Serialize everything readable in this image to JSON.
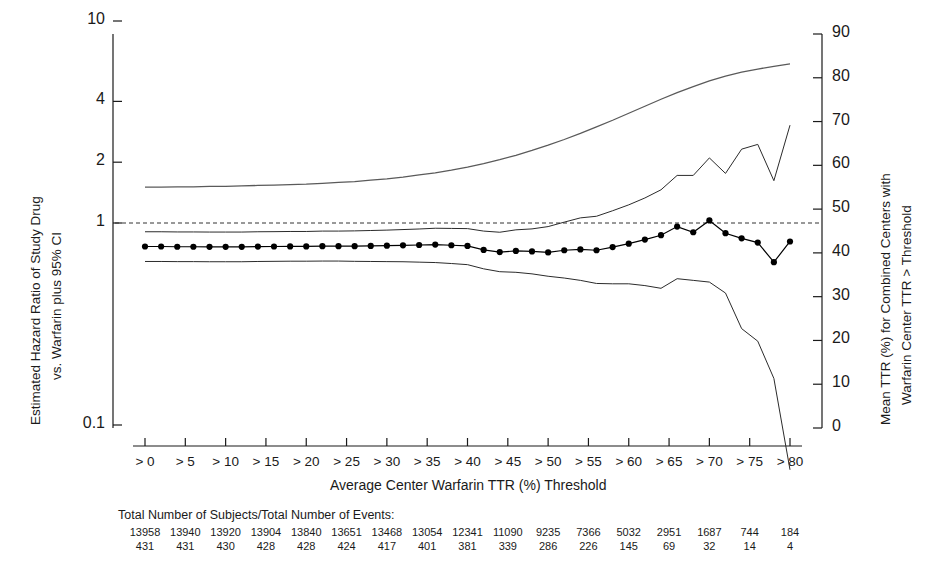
{
  "figure": {
    "background": "#ffffff",
    "ink": "#1a1a1a",
    "ttr_line_color": "#5a5a5a",
    "ci_line_color": "#2b2b2b",
    "point_color": "#000000",
    "reference_line_color": "#333333"
  },
  "axes": {
    "left": {
      "label_line1": "Estimated Hazard Ratio of Study Drug",
      "label_line2": "vs. Warfarin plus 95% CI",
      "scale": "log",
      "ticks": [
        "10",
        "4",
        "2",
        "1",
        "0.1"
      ],
      "tick_values": [
        10,
        4,
        2,
        1,
        0.1
      ],
      "range": [
        0.1,
        10
      ]
    },
    "right": {
      "label_line1": "Mean TTR (%) for Combined Centers with",
      "label_line2": "Warfarin Center TTR > Threshold",
      "scale": "linear",
      "ticks": [
        "90",
        "80",
        "70",
        "60",
        "50",
        "40",
        "30",
        "20",
        "10",
        "0"
      ],
      "tick_values": [
        90,
        80,
        70,
        60,
        50,
        40,
        30,
        20,
        10,
        0
      ],
      "range": [
        0,
        90
      ]
    },
    "x": {
      "label": "Average Center Warfarin TTR (%) Threshold",
      "ticks": [
        "> 0",
        "> 5",
        "> 10",
        "> 15",
        "> 20",
        "> 25",
        "> 30",
        "> 35",
        "> 40",
        "> 45",
        "> 50",
        "> 55",
        "> 60",
        "> 65",
        "> 70",
        "> 75",
        "> 80"
      ],
      "tick_values": [
        0,
        5,
        10,
        15,
        20,
        25,
        30,
        35,
        40,
        45,
        50,
        55,
        60,
        65,
        70,
        75,
        80
      ],
      "range": [
        0,
        80
      ]
    }
  },
  "reference_line": {
    "value": 1,
    "style": "dashed",
    "name": "hazard-ratio-unity"
  },
  "counts_table": {
    "title": "Total Number of Subjects/Total Number of Events:",
    "subjects": [
      13958,
      13940,
      13920,
      13904,
      13840,
      13651,
      13468,
      13054,
      12341,
      11090,
      9235,
      7366,
      5032,
      2951,
      1687,
      744,
      184
    ],
    "events": [
      431,
      431,
      430,
      428,
      428,
      424,
      417,
      401,
      381,
      339,
      286,
      226,
      145,
      69,
      32,
      14,
      4
    ]
  },
  "chart_data": {
    "type": "line",
    "title": "",
    "xlabel": "Average Center Warfarin TTR (%) Threshold",
    "ylabel": "Estimated Hazard Ratio of Study Drug vs. Warfarin plus 95% CI",
    "ylabel_right": "Mean TTR (%) for Combined Centers with Warfarin Center TTR > Threshold",
    "ylim": [
      0.1,
      10
    ],
    "ylim_right": [
      0,
      90
    ],
    "xlim": [
      0,
      80
    ],
    "yscale": "log",
    "grid": false,
    "legend": "none",
    "x": [
      0,
      2,
      4,
      6,
      8,
      10,
      12,
      14,
      16,
      18,
      20,
      22,
      24,
      26,
      28,
      30,
      32,
      34,
      36,
      38,
      40,
      42,
      44,
      46,
      48,
      50,
      52,
      54,
      56,
      58,
      60,
      62,
      64,
      66,
      68,
      70,
      72,
      74,
      76,
      78,
      80
    ],
    "series": [
      {
        "name": "Hazard Ratio (point estimate)",
        "axis": "left",
        "marker": "filled-circle",
        "values": [
          0.765,
          0.765,
          0.763,
          0.763,
          0.762,
          0.762,
          0.762,
          0.764,
          0.765,
          0.766,
          0.766,
          0.768,
          0.768,
          0.768,
          0.77,
          0.772,
          0.775,
          0.778,
          0.782,
          0.776,
          0.77,
          0.736,
          0.718,
          0.727,
          0.723,
          0.715,
          0.733,
          0.74,
          0.733,
          0.76,
          0.79,
          0.828,
          0.87,
          0.96,
          0.9,
          1.03,
          0.89,
          0.84,
          0.8,
          0.64,
          0.81
        ]
      },
      {
        "name": "Upper 95% CI",
        "axis": "left",
        "marker": "none",
        "values": [
          0.905,
          0.905,
          0.903,
          0.903,
          0.902,
          0.902,
          0.902,
          0.905,
          0.906,
          0.908,
          0.908,
          0.912,
          0.912,
          0.914,
          0.918,
          0.922,
          0.928,
          0.934,
          0.942,
          0.94,
          0.938,
          0.912,
          0.9,
          0.925,
          0.935,
          0.96,
          1.01,
          1.06,
          1.08,
          1.15,
          1.23,
          1.33,
          1.46,
          1.72,
          1.72,
          2.1,
          1.76,
          2.32,
          2.45,
          1.62,
          3.05
        ]
      },
      {
        "name": "Lower 95% CI",
        "axis": "left",
        "marker": "none",
        "values": [
          0.645,
          0.645,
          0.644,
          0.644,
          0.643,
          0.643,
          0.643,
          0.645,
          0.646,
          0.647,
          0.647,
          0.648,
          0.648,
          0.646,
          0.645,
          0.644,
          0.643,
          0.64,
          0.637,
          0.63,
          0.622,
          0.593,
          0.574,
          0.57,
          0.56,
          0.545,
          0.534,
          0.52,
          0.502,
          0.5,
          0.5,
          0.49,
          0.475,
          0.53,
          0.52,
          0.51,
          0.45,
          0.3,
          0.26,
          0.17,
          0.06
        ]
      },
      {
        "name": "Mean TTR (%) for combined centers",
        "axis": "right",
        "marker": "none",
        "values": [
          55.0,
          55.0,
          55.1,
          55.1,
          55.2,
          55.2,
          55.3,
          55.4,
          55.5,
          55.6,
          55.7,
          55.9,
          56.1,
          56.3,
          56.6,
          56.9,
          57.3,
          57.8,
          58.3,
          58.9,
          59.6,
          60.4,
          61.3,
          62.3,
          63.4,
          64.6,
          65.9,
          67.3,
          68.8,
          70.3,
          71.9,
          73.5,
          75.1,
          76.6,
          78.0,
          79.3,
          80.4,
          81.3,
          82.0,
          82.6,
          83.2
        ]
      }
    ]
  }
}
